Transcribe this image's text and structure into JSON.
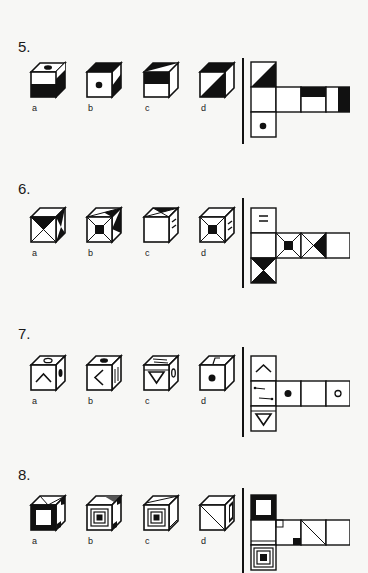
{
  "problems": [
    {
      "number": "5.",
      "options": [
        {
          "label": "a",
          "description": "cube with black circle on top, bottom half of front black, right side black"
        },
        {
          "label": "b",
          "description": "cube with black dot on front, top black, right side with black lower triangle"
        },
        {
          "label": "c",
          "description": "cube with top half triangle black, front upper half black"
        },
        {
          "label": "d",
          "description": "cube with top black, front diagonal lower-right black"
        }
      ],
      "net": {
        "layout": "cross-left",
        "faces": [
          "diagonal-black-top",
          "blank",
          "blank",
          "top-half-black",
          "right-half-black",
          "black-dot"
        ]
      }
    },
    {
      "number": "6.",
      "options": [
        {
          "label": "a",
          "description": "cube with hourglass X front, top triangle black"
        },
        {
          "label": "b",
          "description": "cube with small black square front in X frame"
        },
        {
          "label": "c",
          "description": "cube with blank front, two dashes on right side"
        },
        {
          "label": "d",
          "description": "cube with black square front, dashes on right"
        }
      ],
      "net": {
        "layout": "cross-left",
        "faces": [
          "two-dashes",
          "blank",
          "x-black-square",
          "x-black-triangle",
          "blank",
          "hourglass-black"
        ]
      }
    },
    {
      "number": "7.",
      "options": [
        {
          "label": "a",
          "description": "cube with caret up front, hollow circle top, black oval right"
        },
        {
          "label": "b",
          "description": "cube with caret left front, black oval top, arrows right"
        },
        {
          "label": "c",
          "description": "cube with down triangle front, arrows top, hollow oval right"
        },
        {
          "label": "d",
          "description": "cube with black dot front, angled marker on top"
        }
      ],
      "net": {
        "layout": "cross-left",
        "faces": [
          "caret-up",
          "two-arrows",
          "black-dot",
          "blank",
          "hollow-circle",
          "down-triangle"
        ]
      }
    },
    {
      "number": "8.",
      "options": [
        {
          "label": "a",
          "description": "cube with thick black frame front, diagonal top"
        },
        {
          "label": "b",
          "description": "cube with concentric squares front"
        },
        {
          "label": "c",
          "description": "cube with concentric squares front, diagonal top"
        },
        {
          "label": "d",
          "description": "cube with diagonal front, black bar on right"
        }
      ],
      "net": {
        "layout": "cross-left",
        "faces": [
          "thick-black-frame",
          "line-bottom",
          "corner-squares",
          "diagonal",
          "blank",
          "concentric-squares"
        ]
      }
    }
  ]
}
